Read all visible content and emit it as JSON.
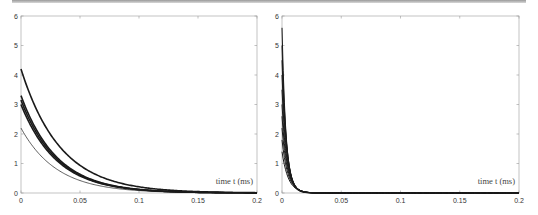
{
  "chart_data": [
    {
      "type": "line",
      "title": "",
      "xlabel": "time t (ms)",
      "ylabel": "",
      "xlim": [
        0,
        0.2
      ],
      "ylim": [
        0,
        6
      ],
      "xticks": [
        "0",
        "0.05",
        "0.1",
        "0.15",
        "0.2"
      ],
      "yticks": [
        "0",
        "1",
        "2",
        "3",
        "4",
        "5",
        "6"
      ],
      "grid": false,
      "legend": null,
      "series": [
        {
          "name": "curve-1",
          "initial": 4.2,
          "decay_rate": 30,
          "stroke_width": 1.6
        },
        {
          "name": "curve-2",
          "initial": 3.3,
          "decay_rate": 33,
          "stroke_width": 1.6
        },
        {
          "name": "curve-3",
          "initial": 3.15,
          "decay_rate": 33,
          "stroke_width": 1.6
        },
        {
          "name": "curve-4",
          "initial": 3.0,
          "decay_rate": 33,
          "stroke_width": 1.6
        },
        {
          "name": "curve-5",
          "initial": 2.2,
          "decay_rate": 33,
          "stroke_width": 0.7
        }
      ]
    },
    {
      "type": "line",
      "title": "",
      "xlabel": "time t (ms)",
      "ylabel": "",
      "xlim": [
        0,
        0.2
      ],
      "ylim": [
        0,
        6
      ],
      "xticks": [
        "0",
        "0.05",
        "0.1",
        "0.15",
        "0.2"
      ],
      "yticks": [
        "0",
        "1",
        "2",
        "3",
        "4",
        "5",
        "6"
      ],
      "grid": false,
      "legend": null,
      "series": [
        {
          "name": "curve-1",
          "initial": 5.6,
          "decay_rate": 300,
          "stroke_width": 1.0
        },
        {
          "name": "curve-2",
          "initial": 5.0,
          "decay_rate": 280,
          "stroke_width": 1.0
        },
        {
          "name": "curve-3",
          "initial": 4.5,
          "decay_rate": 260,
          "stroke_width": 1.0
        },
        {
          "name": "curve-4",
          "initial": 4.0,
          "decay_rate": 250,
          "stroke_width": 1.0
        },
        {
          "name": "curve-5",
          "initial": 3.5,
          "decay_rate": 240,
          "stroke_width": 1.0
        },
        {
          "name": "curve-6",
          "initial": 3.0,
          "decay_rate": 230,
          "stroke_width": 1.0
        },
        {
          "name": "curve-7",
          "initial": 2.6,
          "decay_rate": 220,
          "stroke_width": 1.0
        },
        {
          "name": "curve-8",
          "initial": 2.2,
          "decay_rate": 210,
          "stroke_width": 1.0
        },
        {
          "name": "curve-9",
          "initial": 1.8,
          "decay_rate": 200,
          "stroke_width": 1.0
        },
        {
          "name": "curve-10",
          "initial": 1.4,
          "decay_rate": 190,
          "stroke_width": 1.0
        }
      ]
    }
  ]
}
